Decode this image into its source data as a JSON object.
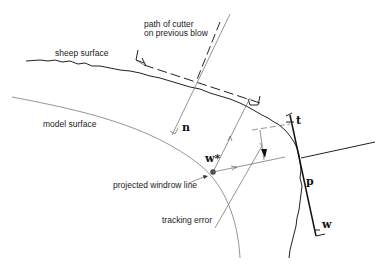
{
  "diagram": {
    "labels": {
      "cutter_path_line1": "path of cutter",
      "cutter_path_line2": "on previous blow",
      "sheep_surface": "sheep surface",
      "model_surface": "model surface",
      "projected_windrow": "projected windrow line",
      "tracking_error": "tracking error"
    },
    "symbols": {
      "n": "n",
      "w_star": "w*",
      "t": "t",
      "p": "p",
      "w": "w"
    },
    "colors": {
      "line": "#222222",
      "thin_line": "#666666",
      "background": "#ffffff"
    }
  }
}
